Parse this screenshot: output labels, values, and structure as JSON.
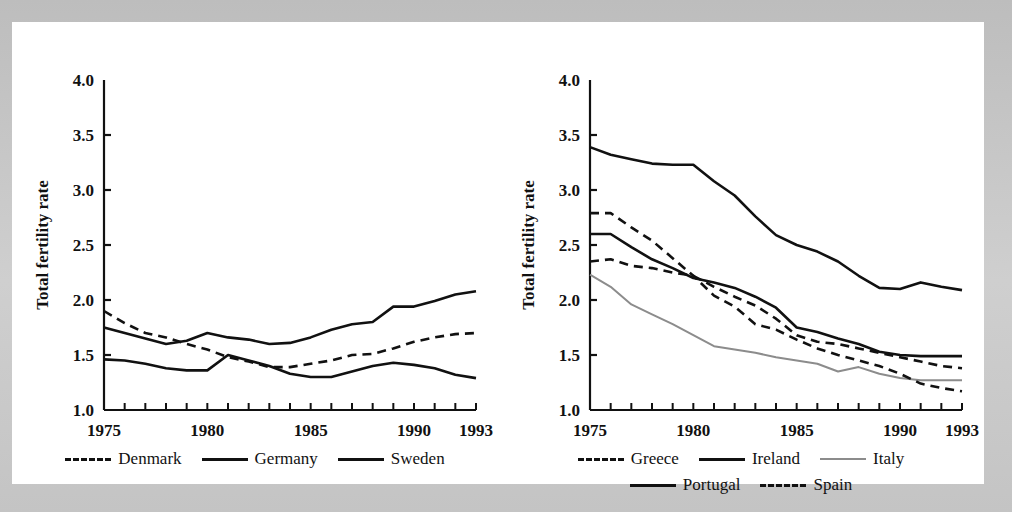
{
  "figure": {
    "page_background": "#c9c9c9",
    "sheet_background": "#ffffff",
    "ink_color": "#111111",
    "gray_series_color": "#8c8c8c"
  },
  "panels": [
    {
      "id": "left",
      "y_axis_title": "Total fertility rate",
      "y_ticks": [
        "1.0",
        "1.5",
        "2.0",
        "2.5",
        "3.0",
        "3.5",
        "4.0"
      ],
      "x_ticks_labeled": [
        "1975",
        "1980",
        "1985",
        "1990",
        "1993"
      ],
      "legend": [
        {
          "name": "Denmark",
          "style": "dashed",
          "color": "#111111"
        },
        {
          "name": "Germany",
          "style": "solid",
          "color": "#111111"
        },
        {
          "name": "Sweden",
          "style": "solid",
          "color": "#111111"
        }
      ]
    },
    {
      "id": "right",
      "y_axis_title": "Total fertility rate",
      "y_ticks": [
        "1.0",
        "1.5",
        "2.0",
        "2.5",
        "3.0",
        "3.5",
        "4.0"
      ],
      "x_ticks_labeled": [
        "1975",
        "1980",
        "1985",
        "1990",
        "1993"
      ],
      "legend": [
        {
          "name": "Greece",
          "style": "dashed",
          "color": "#111111"
        },
        {
          "name": "Ireland",
          "style": "solid",
          "color": "#111111"
        },
        {
          "name": "Italy",
          "style": "solid",
          "color": "#8c8c8c"
        },
        {
          "name": "Portugal",
          "style": "solid",
          "color": "#111111"
        },
        {
          "name": "Spain",
          "style": "dashed",
          "color": "#111111"
        }
      ]
    }
  ],
  "chart_data": [
    {
      "type": "line",
      "panel": "left",
      "title": "",
      "xlabel": "",
      "ylabel": "Total fertility rate",
      "xlim": [
        1975,
        1993
      ],
      "ylim": [
        1.0,
        4.0
      ],
      "yticks": [
        1.0,
        1.5,
        2.0,
        2.5,
        3.0,
        3.5,
        4.0
      ],
      "xticks": [
        1975,
        1976,
        1977,
        1978,
        1979,
        1980,
        1981,
        1982,
        1983,
        1984,
        1985,
        1986,
        1987,
        1988,
        1989,
        1990,
        1991,
        1992,
        1993
      ],
      "xticks_labeled": [
        1975,
        1980,
        1985,
        1990,
        1993
      ],
      "grid": false,
      "legend_position": "below",
      "x": [
        1975,
        1976,
        1977,
        1978,
        1979,
        1980,
        1981,
        1982,
        1983,
        1984,
        1985,
        1986,
        1987,
        1988,
        1989,
        1990,
        1991,
        1992,
        1993
      ],
      "series": [
        {
          "name": "Denmark",
          "style": "dashed",
          "color": "#111111",
          "values": [
            1.9,
            1.79,
            1.7,
            1.66,
            1.6,
            1.55,
            1.48,
            1.44,
            1.39,
            1.39,
            1.42,
            1.45,
            1.5,
            1.51,
            1.56,
            1.62,
            1.66,
            1.69,
            1.7
          ]
        },
        {
          "name": "Germany",
          "style": "solid",
          "color": "#111111",
          "values": [
            1.75,
            1.7,
            1.65,
            1.6,
            1.63,
            1.7,
            1.66,
            1.64,
            1.6,
            1.61,
            1.66,
            1.73,
            1.78,
            1.8,
            1.94,
            1.94,
            1.99,
            2.05,
            2.08
          ]
        },
        {
          "name": "Sweden",
          "style": "solid",
          "color": "#111111",
          "values": [
            1.46,
            1.45,
            1.42,
            1.38,
            1.36,
            1.36,
            1.5,
            1.45,
            1.4,
            1.33,
            1.3,
            1.3,
            1.35,
            1.4,
            1.43,
            1.41,
            1.38,
            1.32,
            1.29
          ]
        }
      ]
    },
    {
      "type": "line",
      "panel": "right",
      "title": "",
      "xlabel": "",
      "ylabel": "Total fertility rate",
      "xlim": [
        1975,
        1993
      ],
      "ylim": [
        1.0,
        4.0
      ],
      "yticks": [
        1.0,
        1.5,
        2.0,
        2.5,
        3.0,
        3.5,
        4.0
      ],
      "xticks": [
        1975,
        1976,
        1977,
        1978,
        1979,
        1980,
        1981,
        1982,
        1983,
        1984,
        1985,
        1986,
        1987,
        1988,
        1989,
        1990,
        1991,
        1992,
        1993
      ],
      "xticks_labeled": [
        1975,
        1980,
        1985,
        1990,
        1993
      ],
      "grid": false,
      "legend_position": "below",
      "x": [
        1975,
        1976,
        1977,
        1978,
        1979,
        1980,
        1981,
        1982,
        1983,
        1984,
        1985,
        1986,
        1987,
        1988,
        1989,
        1990,
        1991,
        1992,
        1993
      ],
      "series": [
        {
          "name": "Greece",
          "style": "dashed",
          "color": "#111111",
          "values": [
            2.35,
            2.37,
            2.31,
            2.29,
            2.25,
            2.22,
            2.12,
            2.03,
            1.95,
            1.83,
            1.68,
            1.62,
            1.6,
            1.56,
            1.52,
            1.48,
            1.44,
            1.4,
            1.38
          ]
        },
        {
          "name": "Ireland",
          "style": "solid",
          "color": "#111111",
          "values": [
            3.39,
            3.32,
            3.28,
            3.24,
            3.23,
            3.23,
            3.08,
            2.95,
            2.76,
            2.59,
            2.5,
            2.44,
            2.35,
            2.22,
            2.11,
            2.1,
            2.16,
            2.12,
            2.09
          ]
        },
        {
          "name": "Italy",
          "style": "solid",
          "color": "#8c8c8c",
          "values": [
            2.23,
            2.12,
            1.96,
            1.87,
            1.78,
            1.68,
            1.58,
            1.55,
            1.52,
            1.48,
            1.45,
            1.42,
            1.35,
            1.39,
            1.33,
            1.29,
            1.27,
            1.27,
            1.27
          ]
        },
        {
          "name": "Portugal",
          "style": "solid",
          "color": "#111111",
          "values": [
            2.6,
            2.6,
            2.48,
            2.37,
            2.29,
            2.2,
            2.16,
            2.11,
            2.03,
            1.93,
            1.75,
            1.71,
            1.65,
            1.6,
            1.53,
            1.5,
            1.49,
            1.49,
            1.49
          ]
        },
        {
          "name": "Spain",
          "style": "dashed",
          "color": "#111111",
          "values": [
            2.79,
            2.79,
            2.66,
            2.54,
            2.38,
            2.22,
            2.04,
            1.94,
            1.78,
            1.73,
            1.64,
            1.56,
            1.5,
            1.45,
            1.4,
            1.33,
            1.24,
            1.2,
            1.17
          ]
        }
      ]
    }
  ]
}
